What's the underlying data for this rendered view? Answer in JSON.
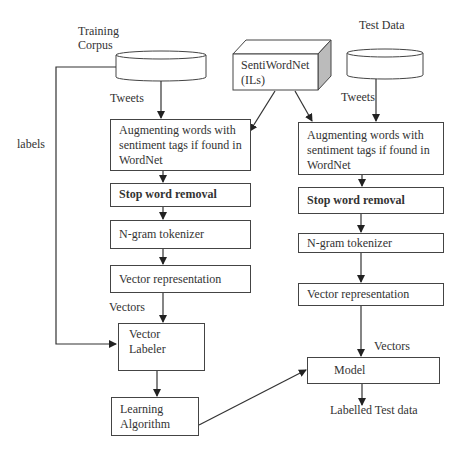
{
  "sources": {
    "training_corpus": "Training\nCorpus",
    "training_line1": "Training",
    "training_line2": "Corpus",
    "test_data": "Test Data",
    "sentiwordnet_line1": "SentiWordNet",
    "sentiwordnet_line2": "(ILs)"
  },
  "edge_labels": {
    "tweets_left": "Tweets",
    "tweets_right": "Tweets",
    "labels": "labels",
    "vectors_left": "Vectors",
    "vectors_right": "Vectors",
    "output": "Labelled Test data"
  },
  "left_pipeline": [
    {
      "line1": "Augmenting words with",
      "line2": "sentiment tags if found in",
      "line3": "WordNet"
    },
    {
      "label": "Stop word removal"
    },
    {
      "label": "N-gram tokenizer"
    },
    {
      "label": "Vector representation"
    },
    {
      "label": "Vector Labeler"
    },
    {
      "line1": "Learning",
      "line2": "Algorithm"
    }
  ],
  "right_pipeline": [
    {
      "line1": "Augmenting words with",
      "line2": "sentiment tags if found in",
      "line3": "WordNet"
    },
    {
      "label": "Stop word removal"
    },
    {
      "label": "N-gram tokenizer"
    },
    {
      "label": "Vector representation"
    },
    {
      "label": "Model"
    }
  ]
}
